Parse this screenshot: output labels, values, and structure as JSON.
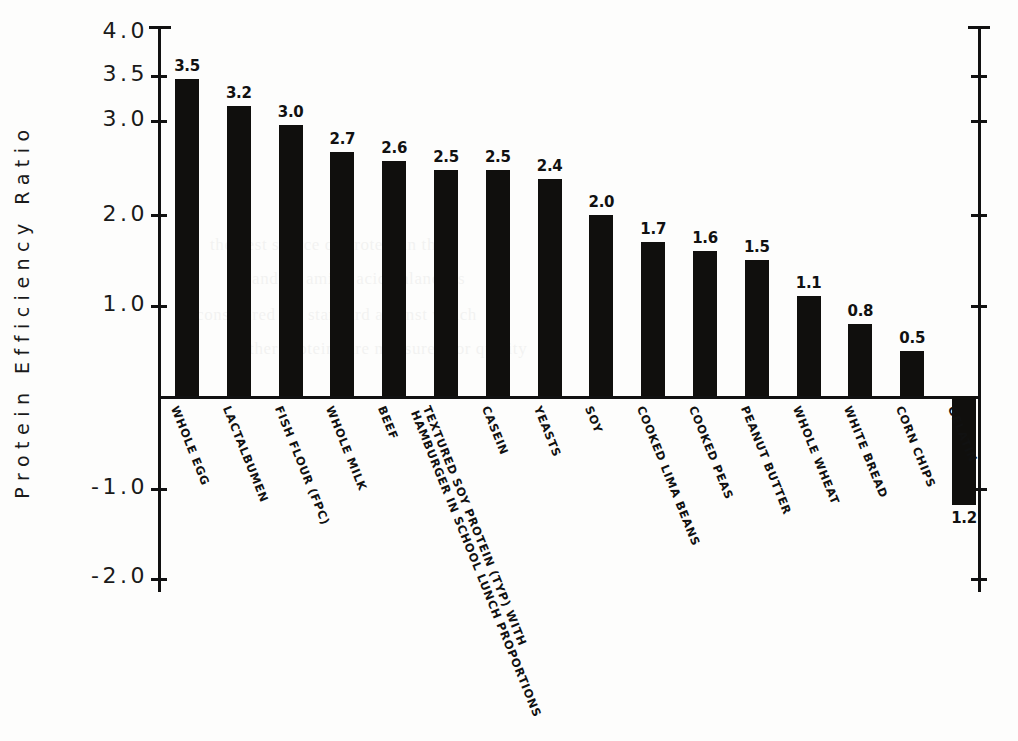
{
  "chart_data": {
    "type": "bar",
    "title": "",
    "xlabel": "",
    "ylabel": "Protein Efficiency Ratio",
    "ylim": [
      -2.0,
      4.0
    ],
    "grid": false,
    "legend": "none",
    "ytick_labels": [
      "4.0",
      "3.5",
      "3.0",
      "2.0",
      "1.0",
      "-1.0",
      "-2.0"
    ],
    "ytick_values": [
      4.0,
      3.5,
      3.0,
      2.0,
      1.0,
      -1.0,
      -2.0
    ],
    "categories": [
      "WHOLE EGG",
      "LACTALBUMEN",
      "FISH FLOUR (FPC)",
      "WHOLE MILK",
      "BEEF",
      "TEXTURED SOY PROTEIN (TYP) WITH HAMBURGER IN SCHOOL LUNCH PROPORTIONS",
      "CASEIN",
      "YEASTS",
      "SOY",
      "COOKED LIMA BEANS",
      "COOKED PEAS",
      "PEANUT BUTTER",
      "WHOLE WHEAT",
      "WHITE BREAD",
      "CORN CHIPS",
      "GELATIN"
    ],
    "values": [
      3.5,
      3.2,
      3.0,
      2.7,
      2.6,
      2.5,
      2.5,
      2.4,
      2.0,
      1.7,
      1.6,
      1.5,
      1.1,
      0.8,
      0.5,
      -1.2
    ],
    "value_labels": [
      "3.5",
      "3.2",
      "3.0",
      "2.7",
      "2.6",
      "2.5",
      "2.5",
      "2.4",
      "2.0",
      "1.7",
      "1.6",
      "1.5",
      "1.1",
      "0.8",
      "0.5",
      "1.2"
    ],
    "bar_color": "#100f0d",
    "axis_color": "#111111",
    "background_color": "#fdfdfc"
  },
  "labels": {
    "soy_protein_line1": "TEXTURED SOY PROTEIN (TYP) WITH",
    "soy_protein_line2": "HAMBURGER IN SCHOOL LUNCH PROPORTIONS"
  },
  "caption": {
    "text": ""
  },
  "ghost_text": {
    "lines": [
      "the best source of protein in the",
      "and its amino acid balance is",
      "considered the standard against which",
      "other proteins are measured for quality"
    ]
  }
}
